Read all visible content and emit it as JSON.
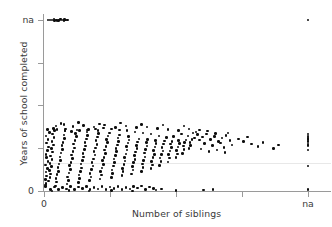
{
  "chart_data": {
    "type": "scatter",
    "title": "",
    "xlabel": "Number of siblings",
    "ylabel": "Years of school completed",
    "grid": "single faint horizontal gridline",
    "legend": "none",
    "x_ticks": [
      {
        "value": 0,
        "label": "0"
      },
      {
        "value": 1,
        "label": ""
      },
      {
        "value": 2,
        "label": ""
      },
      {
        "value": 3,
        "label": ""
      },
      {
        "value": 4,
        "label": "na"
      }
    ],
    "y_ticks": [
      {
        "value": 4,
        "label": "na"
      },
      {
        "value": 3,
        "label": ""
      },
      {
        "value": 2,
        "label": ""
      },
      {
        "value": 1,
        "label": ""
      },
      {
        "value": 0,
        "label": "0"
      }
    ],
    "xlim": [
      -0.05,
      4.35
    ],
    "ylim": [
      -0.1,
      4.2
    ],
    "points": [
      [
        0.06,
        4.0
      ],
      [
        0.09,
        4.0
      ],
      [
        0.12,
        4.0
      ],
      [
        0.16,
        3.99
      ],
      [
        0.19,
        4.0
      ],
      [
        0.22,
        3.99
      ],
      [
        0.24,
        4.0
      ],
      [
        0.27,
        4.0
      ],
      [
        0.3,
        3.99
      ],
      [
        0.33,
        4.0
      ],
      [
        0.36,
        4.0
      ],
      [
        0.15,
        4.02
      ],
      [
        0.25,
        4.02
      ],
      [
        0.31,
        4.01
      ],
      [
        0.2,
        3.98
      ],
      [
        4.0,
        4.0
      ],
      [
        4.0,
        1.16
      ],
      [
        4.0,
        1.2
      ],
      [
        4.0,
        1.23
      ],
      [
        4.0,
        1.26
      ],
      [
        4.0,
        1.29
      ],
      [
        4.0,
        1.33
      ],
      [
        4.0,
        1.1
      ],
      [
        4.0,
        1.06
      ],
      [
        4.0,
        0.96
      ],
      [
        4.0,
        0.58
      ],
      [
        4.0,
        0.04
      ],
      [
        0.02,
        0.1
      ],
      [
        0.03,
        0.18
      ],
      [
        0.02,
        0.27
      ],
      [
        0.04,
        0.35
      ],
      [
        0.03,
        0.44
      ],
      [
        0.05,
        0.52
      ],
      [
        0.02,
        0.61
      ],
      [
        0.06,
        0.69
      ],
      [
        0.04,
        0.78
      ],
      [
        0.03,
        0.86
      ],
      [
        0.05,
        0.95
      ],
      [
        0.07,
        1.03
      ],
      [
        0.04,
        1.12
      ],
      [
        0.06,
        1.2
      ],
      [
        0.03,
        1.29
      ],
      [
        0.08,
        1.37
      ],
      [
        0.05,
        1.44
      ],
      [
        0.02,
        0.14
      ],
      [
        0.07,
        0.23
      ],
      [
        0.09,
        0.31
      ],
      [
        0.1,
        0.4
      ],
      [
        0.08,
        0.48
      ],
      [
        0.11,
        0.57
      ],
      [
        0.09,
        0.65
      ],
      [
        0.12,
        0.74
      ],
      [
        0.1,
        0.82
      ],
      [
        0.13,
        0.91
      ],
      [
        0.11,
        0.99
      ],
      [
        0.14,
        1.08
      ],
      [
        0.12,
        1.16
      ],
      [
        0.15,
        1.25
      ],
      [
        0.13,
        1.33
      ],
      [
        0.16,
        1.41
      ],
      [
        0.14,
        1.46
      ],
      [
        0.17,
        0.12
      ],
      [
        0.19,
        0.21
      ],
      [
        0.18,
        0.29
      ],
      [
        0.2,
        0.38
      ],
      [
        0.22,
        0.46
      ],
      [
        0.21,
        0.55
      ],
      [
        0.23,
        0.63
      ],
      [
        0.25,
        0.72
      ],
      [
        0.24,
        0.8
      ],
      [
        0.26,
        0.89
      ],
      [
        0.28,
        0.97
      ],
      [
        0.27,
        1.06
      ],
      [
        0.29,
        1.14
      ],
      [
        0.31,
        1.23
      ],
      [
        0.3,
        1.31
      ],
      [
        0.32,
        1.4
      ],
      [
        0.33,
        1.45
      ],
      [
        0.35,
        0.16
      ],
      [
        0.37,
        0.25
      ],
      [
        0.36,
        0.33
      ],
      [
        0.38,
        0.42
      ],
      [
        0.4,
        0.5
      ],
      [
        0.39,
        0.59
      ],
      [
        0.41,
        0.67
      ],
      [
        0.43,
        0.76
      ],
      [
        0.42,
        0.84
      ],
      [
        0.44,
        0.93
      ],
      [
        0.46,
        1.01
      ],
      [
        0.45,
        1.1
      ],
      [
        0.47,
        1.18
      ],
      [
        0.49,
        1.27
      ],
      [
        0.48,
        1.35
      ],
      [
        0.5,
        1.43
      ],
      [
        0.52,
        0.2
      ],
      [
        0.54,
        0.29
      ],
      [
        0.53,
        0.37
      ],
      [
        0.55,
        0.46
      ],
      [
        0.57,
        0.54
      ],
      [
        0.56,
        0.63
      ],
      [
        0.58,
        0.71
      ],
      [
        0.6,
        0.8
      ],
      [
        0.59,
        0.88
      ],
      [
        0.61,
        0.97
      ],
      [
        0.63,
        1.05
      ],
      [
        0.62,
        1.14
      ],
      [
        0.64,
        1.22
      ],
      [
        0.66,
        1.3
      ],
      [
        0.65,
        1.38
      ],
      [
        0.67,
        1.44
      ],
      [
        0.69,
        0.24
      ],
      [
        0.71,
        0.33
      ],
      [
        0.7,
        0.41
      ],
      [
        0.72,
        0.5
      ],
      [
        0.74,
        0.58
      ],
      [
        0.73,
        0.67
      ],
      [
        0.75,
        0.75
      ],
      [
        0.77,
        0.84
      ],
      [
        0.76,
        0.92
      ],
      [
        0.78,
        1.01
      ],
      [
        0.8,
        1.09
      ],
      [
        0.79,
        1.18
      ],
      [
        0.81,
        1.26
      ],
      [
        0.83,
        1.34
      ],
      [
        0.82,
        1.41
      ],
      [
        0.85,
        0.28
      ],
      [
        0.87,
        0.37
      ],
      [
        0.86,
        0.45
      ],
      [
        0.88,
        0.54
      ],
      [
        0.9,
        0.62
      ],
      [
        0.89,
        0.71
      ],
      [
        0.91,
        0.79
      ],
      [
        0.93,
        0.88
      ],
      [
        0.92,
        0.96
      ],
      [
        0.94,
        1.04
      ],
      [
        0.96,
        1.13
      ],
      [
        0.95,
        1.21
      ],
      [
        0.97,
        1.29
      ],
      [
        0.99,
        1.36
      ],
      [
        1.02,
        0.32
      ],
      [
        1.04,
        0.41
      ],
      [
        1.03,
        0.49
      ],
      [
        1.05,
        0.58
      ],
      [
        1.07,
        0.66
      ],
      [
        1.06,
        0.75
      ],
      [
        1.08,
        0.83
      ],
      [
        1.1,
        0.92
      ],
      [
        1.09,
        1.0
      ],
      [
        1.11,
        1.08
      ],
      [
        1.13,
        1.16
      ],
      [
        1.12,
        1.24
      ],
      [
        1.14,
        1.31
      ],
      [
        1.18,
        0.36
      ],
      [
        1.2,
        0.45
      ],
      [
        1.19,
        0.53
      ],
      [
        1.21,
        0.62
      ],
      [
        1.23,
        0.7
      ],
      [
        1.22,
        0.79
      ],
      [
        1.24,
        0.87
      ],
      [
        1.26,
        0.96
      ],
      [
        1.25,
        1.04
      ],
      [
        1.27,
        1.12
      ],
      [
        1.29,
        1.19
      ],
      [
        1.28,
        1.27
      ],
      [
        1.33,
        0.4
      ],
      [
        1.35,
        0.49
      ],
      [
        1.34,
        0.57
      ],
      [
        1.36,
        0.66
      ],
      [
        1.38,
        0.74
      ],
      [
        1.37,
        0.83
      ],
      [
        1.39,
        0.91
      ],
      [
        1.41,
        0.99
      ],
      [
        1.4,
        1.07
      ],
      [
        1.42,
        1.15
      ],
      [
        1.44,
        1.22
      ],
      [
        1.48,
        0.46
      ],
      [
        1.5,
        0.55
      ],
      [
        1.49,
        0.63
      ],
      [
        1.51,
        0.72
      ],
      [
        1.53,
        0.8
      ],
      [
        1.52,
        0.89
      ],
      [
        1.54,
        0.97
      ],
      [
        1.56,
        1.05
      ],
      [
        1.55,
        1.13
      ],
      [
        1.57,
        1.2
      ],
      [
        1.62,
        0.52
      ],
      [
        1.64,
        0.61
      ],
      [
        1.63,
        0.69
      ],
      [
        1.65,
        0.78
      ],
      [
        1.67,
        0.86
      ],
      [
        1.66,
        0.95
      ],
      [
        1.68,
        1.03
      ],
      [
        1.7,
        1.11
      ],
      [
        1.69,
        1.18
      ],
      [
        1.75,
        0.6
      ],
      [
        1.77,
        0.69
      ],
      [
        1.76,
        0.77
      ],
      [
        1.78,
        0.86
      ],
      [
        1.8,
        0.94
      ],
      [
        1.79,
        1.02
      ],
      [
        1.81,
        1.1
      ],
      [
        1.83,
        1.17
      ],
      [
        1.88,
        0.68
      ],
      [
        1.9,
        0.77
      ],
      [
        1.89,
        0.85
      ],
      [
        1.91,
        0.94
      ],
      [
        1.93,
        1.02
      ],
      [
        1.92,
        1.1
      ],
      [
        1.94,
        1.16
      ],
      [
        2.0,
        0.78
      ],
      [
        2.02,
        0.87
      ],
      [
        2.01,
        0.95
      ],
      [
        2.03,
        1.03
      ],
      [
        2.05,
        1.11
      ],
      [
        2.04,
        1.18
      ],
      [
        2.1,
        0.88
      ],
      [
        2.12,
        0.97
      ],
      [
        2.11,
        1.05
      ],
      [
        2.13,
        1.13
      ],
      [
        2.15,
        1.19
      ],
      [
        2.2,
        0.99
      ],
      [
        2.22,
        1.07
      ],
      [
        2.21,
        1.14
      ],
      [
        2.24,
        1.2
      ],
      [
        0.1,
        0.04
      ],
      [
        0.22,
        0.03
      ],
      [
        0.34,
        0.05
      ],
      [
        0.46,
        0.04
      ],
      [
        0.58,
        0.06
      ],
      [
        0.7,
        0.03
      ],
      [
        0.82,
        0.05
      ],
      [
        0.94,
        0.04
      ],
      [
        1.06,
        0.06
      ],
      [
        1.18,
        0.03
      ],
      [
        1.3,
        0.05
      ],
      [
        1.42,
        0.07
      ],
      [
        1.54,
        0.04
      ],
      [
        1.66,
        0.06
      ],
      [
        1.78,
        0.05
      ],
      [
        0.16,
        0.09
      ],
      [
        0.28,
        0.08
      ],
      [
        0.4,
        0.1
      ],
      [
        0.52,
        0.09
      ],
      [
        0.64,
        0.11
      ],
      [
        0.76,
        0.08
      ],
      [
        0.88,
        0.1
      ],
      [
        1.0,
        0.09
      ],
      [
        1.12,
        0.11
      ],
      [
        1.24,
        0.08
      ],
      [
        1.36,
        0.1
      ],
      [
        1.48,
        0.12
      ],
      [
        1.6,
        0.09
      ],
      [
        2.33,
        1.32
      ],
      [
        2.4,
        1.26
      ],
      [
        2.46,
        1.33
      ],
      [
        2.52,
        1.21
      ],
      [
        2.58,
        1.28
      ],
      [
        2.64,
        1.16
      ],
      [
        2.7,
        1.24
      ],
      [
        2.76,
        1.3
      ],
      [
        2.82,
        1.18
      ],
      [
        2.36,
        1.19
      ],
      [
        2.43,
        1.11
      ],
      [
        2.55,
        1.06
      ],
      [
        2.67,
        1.12
      ],
      [
        2.73,
        1.02
      ],
      [
        2.85,
        1.08
      ],
      [
        2.3,
        1.38
      ],
      [
        2.48,
        1.4
      ],
      [
        2.6,
        1.35
      ],
      [
        2.79,
        1.36
      ],
      [
        2.38,
        0.98
      ],
      [
        2.5,
        0.92
      ],
      [
        2.62,
        0.96
      ],
      [
        2.74,
        0.9
      ],
      [
        2.95,
        1.22
      ],
      [
        3.02,
        1.16
      ],
      [
        3.08,
        1.26
      ],
      [
        3.14,
        1.1
      ],
      [
        3.24,
        1.04
      ],
      [
        3.32,
        1.14
      ],
      [
        3.48,
        1.0
      ],
      [
        3.55,
        1.08
      ],
      [
        0.18,
        1.52
      ],
      [
        0.3,
        1.55
      ],
      [
        0.44,
        1.51
      ],
      [
        0.6,
        1.53
      ],
      [
        0.76,
        1.5
      ],
      [
        0.92,
        1.54
      ],
      [
        1.08,
        1.49
      ],
      [
        1.24,
        1.52
      ],
      [
        1.4,
        1.48
      ],
      [
        1.56,
        1.5
      ],
      [
        1.72,
        1.46
      ],
      [
        1.88,
        1.44
      ],
      [
        2.04,
        1.42
      ],
      [
        2.2,
        1.45
      ],
      [
        2.36,
        1.43
      ],
      [
        0.26,
        1.58
      ],
      [
        0.52,
        1.6
      ],
      [
        0.84,
        1.57
      ],
      [
        1.16,
        1.59
      ],
      [
        1.48,
        1.56
      ],
      [
        1.8,
        1.54
      ],
      [
        2.12,
        1.52
      ],
      [
        0.12,
        0.0
      ],
      [
        0.38,
        0.01
      ],
      [
        0.68,
        0.0
      ],
      [
        1.02,
        0.01
      ],
      [
        1.34,
        0.0
      ],
      [
        1.7,
        0.02
      ],
      [
        2.0,
        0.01
      ],
      [
        2.42,
        0.02
      ],
      [
        2.56,
        0.04
      ],
      [
        1.96,
        1.27
      ],
      [
        2.08,
        1.33
      ],
      [
        2.18,
        1.29
      ],
      [
        2.26,
        1.36
      ],
      [
        2.28,
        1.24
      ],
      [
        1.86,
        1.25
      ],
      [
        1.74,
        1.29
      ],
      [
        1.62,
        1.33
      ],
      [
        1.5,
        1.36
      ],
      [
        1.38,
        1.38
      ],
      [
        1.26,
        1.41
      ],
      [
        1.14,
        1.43
      ],
      [
        1.02,
        1.45
      ],
      [
        0.9,
        1.47
      ],
      [
        0.78,
        1.45
      ],
      [
        0.66,
        1.43
      ],
      [
        0.54,
        1.41
      ],
      [
        0.42,
        1.39
      ],
      [
        0.32,
        1.42
      ],
      [
        0.2,
        1.44
      ]
    ]
  },
  "axes": {
    "y_title": "Years of school completed",
    "x_title": "Number of siblings",
    "y_top_label": "na",
    "y_bottom_label": "0",
    "x_left_label": "0",
    "x_right_label": "na"
  },
  "style": {
    "point_color": "#0d0d0d",
    "axis_color": "#9a9a9a",
    "text_color": "#3a3a3a",
    "grid_color": "#e8e8e8",
    "background": "#ffffff"
  }
}
